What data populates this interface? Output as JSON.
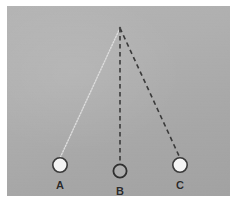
{
  "figure": {
    "caption_present": false,
    "background_color": "#b0b0b0",
    "border_color": "#ffffff"
  },
  "diagram": {
    "type": "pendulum-swing-diagram",
    "pivot": {
      "name": "pivot-point",
      "x": 120,
      "y": 28
    },
    "bobs": [
      {
        "id": "A",
        "label": "A",
        "x": 60,
        "y": 164,
        "radius": 7,
        "fill": "#f2f2f2",
        "stroke": "#333333",
        "label_x": 52,
        "label_y": 176
      },
      {
        "id": "B",
        "label": "B",
        "x": 120,
        "y": 171,
        "radius": 6.5,
        "fill": "#aeaeae",
        "stroke": "#2e2e2e",
        "label_x": 112,
        "label_y": 181
      },
      {
        "id": "C",
        "label": "C",
        "x": 180,
        "y": 164,
        "radius": 7,
        "fill": "#f2f2f2",
        "stroke": "#333333",
        "label_x": 172,
        "label_y": 176
      }
    ],
    "strings": [
      {
        "id": "string-A",
        "from": "pivot",
        "to": "A",
        "style": "dotted",
        "color": "#d8d8d8",
        "width": 1.3,
        "dash": "1,1.6"
      },
      {
        "id": "string-B",
        "from": "pivot",
        "to": "B",
        "style": "dashed",
        "color": "#3a3a3a",
        "width": 1.5,
        "dash": "4,3"
      },
      {
        "id": "string-C",
        "from": "pivot",
        "to": "C",
        "style": "dashed",
        "color": "#3a3a3a",
        "width": 1.5,
        "dash": "4,3"
      }
    ]
  }
}
